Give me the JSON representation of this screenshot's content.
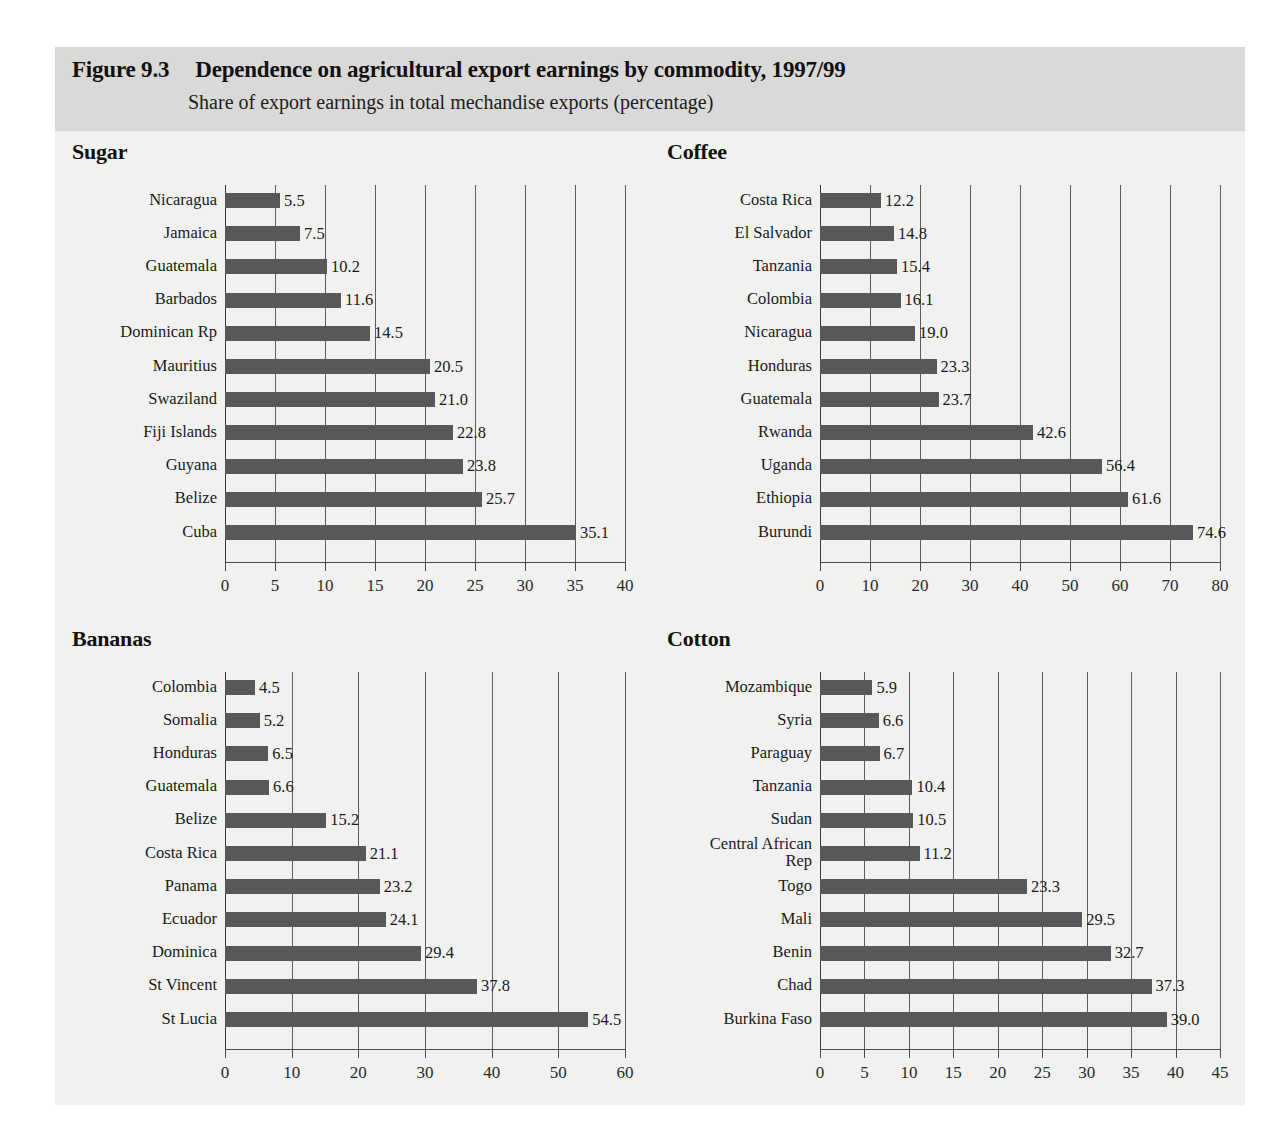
{
  "header": {
    "figure_number": "Figure 9.3",
    "title": "Dependence on agricultural export earnings by commodity, 1997/99",
    "subtitle": "Share of export earnings in total mechandise exports (percentage)"
  },
  "chart_data": [
    {
      "type": "bar",
      "title": "Sugar",
      "orientation": "horizontal",
      "xlabel": "",
      "ylabel": "",
      "xlim": [
        0,
        40
      ],
      "xticks": [
        0,
        5,
        10,
        15,
        20,
        25,
        30,
        35,
        40
      ],
      "grid": true,
      "legend": "none",
      "categories": [
        "Nicaragua",
        "Jamaica",
        "Guatemala",
        "Barbados",
        "Dominican Rp",
        "Mauritius",
        "Swaziland",
        "Fiji Islands",
        "Guyana",
        "Belize",
        "Cuba"
      ],
      "values": [
        5.5,
        7.5,
        10.2,
        11.6,
        14.5,
        20.5,
        21.0,
        22.8,
        23.8,
        25.7,
        35.1
      ],
      "labels": [
        "5.5",
        "7.5",
        "10.2",
        "11.6",
        "14.5",
        "20.5",
        "21.0",
        "22.8",
        "23.8",
        "25.7",
        "35.1"
      ]
    },
    {
      "type": "bar",
      "title": "Coffee",
      "orientation": "horizontal",
      "xlabel": "",
      "ylabel": "",
      "xlim": [
        0,
        80
      ],
      "xticks": [
        0,
        10,
        20,
        30,
        40,
        50,
        60,
        70,
        80
      ],
      "grid": true,
      "legend": "none",
      "categories": [
        "Costa Rica",
        "El Salvador",
        "Tanzania",
        "Colombia",
        "Nicaragua",
        "Honduras",
        "Guatemala",
        "Rwanda",
        "Uganda",
        "Ethiopia",
        "Burundi"
      ],
      "values": [
        12.2,
        14.8,
        15.4,
        16.1,
        19.0,
        23.3,
        23.7,
        42.6,
        56.4,
        61.6,
        74.6
      ],
      "labels": [
        "12.2",
        "14.8",
        "15.4",
        "16.1",
        "19.0",
        "23.3",
        "23.7",
        "42.6",
        "56.4",
        "61.6",
        "74.6"
      ]
    },
    {
      "type": "bar",
      "title": "Bananas",
      "orientation": "horizontal",
      "xlabel": "",
      "ylabel": "",
      "xlim": [
        0,
        60
      ],
      "xticks": [
        0,
        10,
        20,
        30,
        40,
        50,
        60
      ],
      "grid": true,
      "legend": "none",
      "categories": [
        "Colombia",
        "Somalia",
        "Honduras",
        "Guatemala",
        "Belize",
        "Costa Rica",
        "Panama",
        "Ecuador",
        "Dominica",
        "St Vincent",
        "St Lucia"
      ],
      "values": [
        4.5,
        5.2,
        6.5,
        6.6,
        15.2,
        21.1,
        23.2,
        24.1,
        29.4,
        37.8,
        54.5
      ],
      "labels": [
        "4.5",
        "5.2",
        "6.5",
        "6.6",
        "15.2",
        "21.1",
        "23.2",
        "24.1",
        "29.4",
        "37.8",
        "54.5"
      ]
    },
    {
      "type": "bar",
      "title": "Cotton",
      "orientation": "horizontal",
      "xlabel": "",
      "ylabel": "",
      "xlim": [
        0,
        45
      ],
      "xticks": [
        0,
        5,
        10,
        15,
        20,
        25,
        30,
        35,
        40,
        45
      ],
      "grid": true,
      "legend": "none",
      "categories": [
        "Mozambique",
        "Syria",
        "Paraguay",
        "Tanzania",
        "Sudan",
        "Central African\nRep",
        "Togo",
        "Mali",
        "Benin",
        "Chad",
        "Burkina Faso"
      ],
      "values": [
        5.9,
        6.6,
        6.7,
        10.4,
        10.5,
        11.2,
        23.3,
        29.5,
        32.7,
        37.3,
        39.0
      ],
      "labels": [
        "5.9",
        "6.6",
        "6.7",
        "10.4",
        "10.5",
        "11.2",
        "23.3",
        "29.5",
        "32.7",
        "37.3",
        "39.0"
      ]
    }
  ],
  "colors": {
    "bar": "#585858",
    "header_band": "#d9d9d7",
    "panel_background": "#f1f1ef",
    "gridline": "#5c5c5c",
    "text": "#1a1a1a"
  }
}
